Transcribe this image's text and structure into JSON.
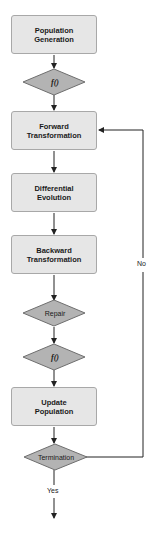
{
  "colors": {
    "box_fill": "#e6e6e6",
    "box_border": "#a8a8a8",
    "diamond_fill": "#b3b3b3",
    "diamond_border": "#6e6e6e",
    "line": "#222222"
  },
  "nodes": {
    "population_generation": {
      "label": "Population\nGeneration",
      "shape": "process"
    },
    "evaluate_1": {
      "label": "f()",
      "shape": "decision"
    },
    "forward_transformation": {
      "label": "Forward\nTransformation",
      "shape": "process"
    },
    "differential_evolution": {
      "label": "Differential\nEvolution",
      "shape": "process"
    },
    "backward_transformation": {
      "label": "Backward\nTransformation",
      "shape": "process"
    },
    "repair": {
      "label": "Repair",
      "shape": "decision"
    },
    "evaluate_2": {
      "label": "f()",
      "shape": "decision"
    },
    "update_population": {
      "label": "Update\nPopulation",
      "shape": "process"
    },
    "termination": {
      "label": "Termination",
      "shape": "decision"
    }
  },
  "edges": {
    "no_label": "No",
    "yes_label": "Yes"
  }
}
